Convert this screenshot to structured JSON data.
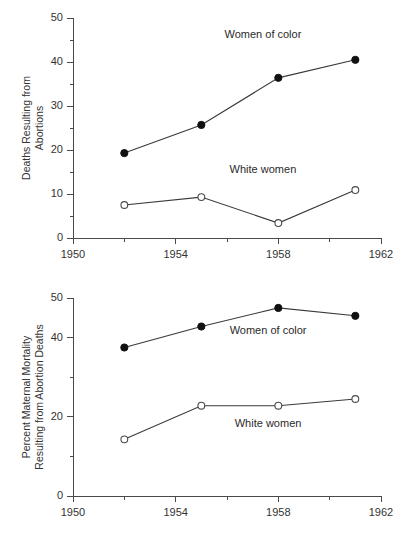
{
  "figure": {
    "background": "#ffffff",
    "line_color": "#3a3a3a",
    "axis_color": "#4a4a4a",
    "text_color": "#333333"
  },
  "chart_data": [
    {
      "type": "line",
      "title": "",
      "xlabel": "",
      "ylabel": "Deaths Resulting from Abortions",
      "ylabel_line1": "Deaths Resulting from",
      "ylabel_line2": "Abortions",
      "x": [
        1952,
        1955,
        1958,
        1961
      ],
      "xlim": [
        1950,
        1962
      ],
      "ylim": [
        0,
        50
      ],
      "xticks": [
        1950,
        1954,
        1958,
        1962
      ],
      "xtick_labels": [
        "1950",
        "1954",
        "1958",
        "1962"
      ],
      "xminor_ticks": [
        1952,
        1956,
        1960
      ],
      "yticks": [
        0,
        10,
        20,
        30,
        40,
        50
      ],
      "ytick_labels": [
        "0",
        "10",
        "20",
        "30",
        "40",
        "50"
      ],
      "yminor_ticks": [
        5,
        15,
        25,
        35,
        45
      ],
      "grid": false,
      "legend_position": "inline-annotations",
      "series": [
        {
          "name": "Women of color",
          "marker": "filled-circle",
          "values": [
            19.3,
            25.7,
            36.4,
            40.5
          ],
          "label_text": "Women of color",
          "label_x": 1957.4,
          "label_y": 45.5
        },
        {
          "name": "White women",
          "marker": "open-circle",
          "values": [
            7.5,
            9.3,
            3.4,
            10.9
          ],
          "label_text": "White women",
          "label_x": 1957.4,
          "label_y": 14.8
        }
      ]
    },
    {
      "type": "line",
      "title": "",
      "xlabel": "",
      "ylabel": "Percent Maternal Mortality Resulting from Abortion Deaths",
      "ylabel_line1": "Percent Maternal Mortality",
      "ylabel_line2": "Resulting from Abortion Deaths",
      "x": [
        1952,
        1955,
        1958,
        1961
      ],
      "xlim": [
        1950,
        1962
      ],
      "ylim": [
        0,
        50
      ],
      "xticks": [
        1950,
        1954,
        1958,
        1962
      ],
      "xtick_labels": [
        "1950",
        "1954",
        "1958",
        "1962"
      ],
      "xminor_ticks": [
        1952,
        1956,
        1960
      ],
      "yticks": [
        0,
        20,
        40,
        50
      ],
      "ytick_labels": [
        "0",
        "20",
        "40",
        "50"
      ],
      "yminor_ticks": [
        10,
        30
      ],
      "grid": false,
      "legend_position": "inline-annotations",
      "series": [
        {
          "name": "Women of color",
          "marker": "filled-circle",
          "values": [
            37.5,
            42.8,
            47.5,
            45.5
          ],
          "label_text": "Women of color",
          "label_x": 1957.6,
          "label_y": 41.0
        },
        {
          "name": "White women",
          "marker": "open-circle",
          "values": [
            14.3,
            22.8,
            22.8,
            24.5
          ],
          "label_text": "White women",
          "label_x": 1957.6,
          "label_y": 17.5
        }
      ]
    }
  ]
}
